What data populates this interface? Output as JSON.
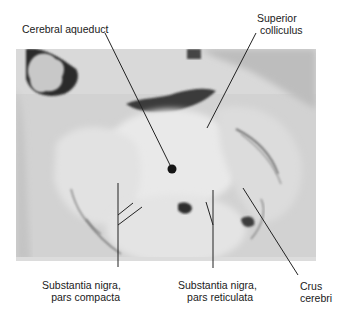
{
  "figure": {
    "labels": [
      {
        "id": "cerebral-aqueduct",
        "lines": [
          "Cerebral aqueduct"
        ]
      },
      {
        "id": "superior-colliculus",
        "lines": [
          "Superior",
          "colliculus"
        ]
      },
      {
        "id": "substantia-nigra-compacta",
        "lines": [
          "Substantia nigra,",
          "pars compacta"
        ]
      },
      {
        "id": "substantia-nigra-reticulata",
        "lines": [
          "Substantia nigra,",
          "pars reticulata"
        ]
      },
      {
        "id": "crus-cerebri",
        "lines": [
          "Crus",
          "cerebri"
        ]
      }
    ],
    "colors": {
      "background": "#ffffff",
      "tissue_light": "#e6e6e6",
      "tissue_mid": "#cfcfcf",
      "dark": "#1e1e1e",
      "leader_line": "#222222"
    }
  }
}
